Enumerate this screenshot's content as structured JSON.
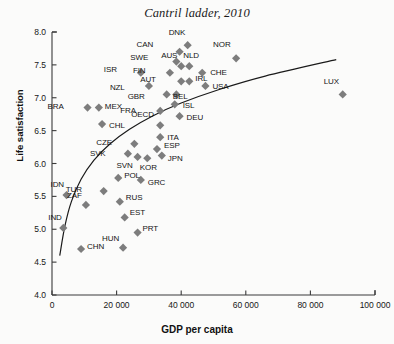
{
  "chart_data": {
    "type": "scatter",
    "title": "Cantril ladder, 2010",
    "xlabel": "GDP per capita",
    "ylabel": "Life satisfaction",
    "xlim": [
      0,
      100000
    ],
    "ylim": [
      4.0,
      8.0
    ],
    "grid": false,
    "legend": null,
    "xticks": [
      "0",
      "20 000",
      "40 000",
      "60 000",
      "80 000",
      "100 000"
    ],
    "xtick_values": [
      0,
      20000,
      40000,
      60000,
      80000,
      100000
    ],
    "yticks": [
      "4.0",
      "4.5",
      "5.0",
      "5.5",
      "6.0",
      "6.5",
      "7.0",
      "7.5",
      "8.0"
    ],
    "ytick_values": [
      4.0,
      4.5,
      5.0,
      5.5,
      6.0,
      6.5,
      7.0,
      7.5,
      8.0
    ],
    "marker": "diamond",
    "marker_color": "#7d7d7d",
    "trendline_color": "#1a1a1a",
    "points": [
      {
        "label": "DNK",
        "x": 42000,
        "y": 7.8,
        "lx": -2,
        "ly": -12
      },
      {
        "label": "CAN",
        "x": 39500,
        "y": 7.7,
        "lx": -26,
        "ly": -7
      },
      {
        "label": "NOR",
        "x": 57000,
        "y": 7.6,
        "lx": -6,
        "ly": -13
      },
      {
        "label": "SWE",
        "x": 38500,
        "y": 7.55,
        "lx": -28,
        "ly": -4
      },
      {
        "label": "AUS",
        "x": 40000,
        "y": 7.48,
        "lx": -4,
        "ly": -10
      },
      {
        "label": "NLD",
        "x": 42500,
        "y": 7.48,
        "lx": 2,
        "ly": -10
      },
      {
        "label": "FIN",
        "x": 36500,
        "y": 7.38,
        "lx": -24,
        "ly": -2
      },
      {
        "label": "CHE",
        "x": 46500,
        "y": 7.38,
        "lx": 8,
        "ly": 0
      },
      {
        "label": "ISR",
        "x": 27500,
        "y": 7.38,
        "lx": -24,
        "ly": -3
      },
      {
        "label": "AUT",
        "x": 40000,
        "y": 7.25,
        "lx": -25,
        "ly": -1
      },
      {
        "label": "IRL",
        "x": 42500,
        "y": 7.25,
        "lx": 6,
        "ly": -2
      },
      {
        "label": "USA",
        "x": 47500,
        "y": 7.18,
        "lx": 7,
        "ly": 1
      },
      {
        "label": "NZL",
        "x": 30000,
        "y": 7.18,
        "lx": -24,
        "ly": 2
      },
      {
        "label": "GBR",
        "x": 35500,
        "y": 7.05,
        "lx": -22,
        "ly": 3
      },
      {
        "label": "BEL",
        "x": 38500,
        "y": 7.05,
        "lx": 4,
        "ly": 3
      },
      {
        "label": "ISL",
        "x": 38000,
        "y": 6.9,
        "lx": 8,
        "ly": 2
      },
      {
        "label": "BRA",
        "x": 11000,
        "y": 6.85,
        "lx": -24,
        "ly": -1
      },
      {
        "label": "MEX",
        "x": 14500,
        "y": 6.85,
        "lx": 6,
        "ly": -1
      },
      {
        "label": "FRA",
        "x": 33500,
        "y": 6.8,
        "lx": -24,
        "ly": 0
      },
      {
        "label": "DEU",
        "x": 39500,
        "y": 6.72,
        "lx": 7,
        "ly": 2
      },
      {
        "label": "CHL",
        "x": 15500,
        "y": 6.6,
        "lx": 7,
        "ly": 2
      },
      {
        "label": "OECD",
        "x": 33500,
        "y": 6.58,
        "lx": -6,
        "ly": -10
      },
      {
        "label": "ITA",
        "x": 33500,
        "y": 6.4,
        "lx": 7,
        "ly": 1
      },
      {
        "label": "CZE",
        "x": 25500,
        "y": 6.3,
        "lx": -22,
        "ly": -1
      },
      {
        "label": "ESP",
        "x": 32500,
        "y": 6.22,
        "lx": 7,
        "ly": -3
      },
      {
        "label": "SVK",
        "x": 23500,
        "y": 6.15,
        "lx": -22,
        "ly": 0
      },
      {
        "label": "JPN",
        "x": 34000,
        "y": 6.12,
        "lx": 6,
        "ly": 3
      },
      {
        "label": "SVN",
        "x": 26500,
        "y": 6.1,
        "lx": -5,
        "ly": 9
      },
      {
        "label": "KOR",
        "x": 29500,
        "y": 6.08,
        "lx": 1,
        "ly": 10
      },
      {
        "label": "POL",
        "x": 20500,
        "y": 5.78,
        "lx": 6,
        "ly": -2
      },
      {
        "label": "GRC",
        "x": 27500,
        "y": 5.75,
        "lx": 7,
        "ly": 3
      },
      {
        "label": "TUR",
        "x": 16000,
        "y": 5.58,
        "lx": -22,
        "ly": -1
      },
      {
        "label": "IDN",
        "x": 4500,
        "y": 5.52,
        "lx": -3,
        "ly": -10
      },
      {
        "label": "RUS",
        "x": 21000,
        "y": 5.42,
        "lx": 6,
        "ly": -4
      },
      {
        "label": "ZAF",
        "x": 10500,
        "y": 5.37,
        "lx": -4,
        "ly": -9
      },
      {
        "label": "EST",
        "x": 22500,
        "y": 5.18,
        "lx": 5,
        "ly": -4
      },
      {
        "label": "IND",
        "x": 3500,
        "y": 5.02,
        "lx": -2,
        "ly": -10
      },
      {
        "label": "PRT",
        "x": 26500,
        "y": 4.95,
        "lx": 5,
        "ly": -4
      },
      {
        "label": "HUN",
        "x": 22000,
        "y": 4.72,
        "lx": -4,
        "ly": -9
      },
      {
        "label": "CHN",
        "x": 9000,
        "y": 4.7,
        "lx": 6,
        "ly": -2
      },
      {
        "label": "LUX",
        "x": 90000,
        "y": 7.05,
        "lx": -4,
        "ly": -12
      }
    ],
    "trendline": {
      "description": "logarithmic fit curve",
      "points": [
        {
          "x": 2400,
          "y": 4.6
        },
        {
          "x": 4000,
          "y": 5.05
        },
        {
          "x": 6000,
          "y": 5.42
        },
        {
          "x": 9000,
          "y": 5.76
        },
        {
          "x": 13000,
          "y": 6.05
        },
        {
          "x": 18000,
          "y": 6.3
        },
        {
          "x": 24000,
          "y": 6.52
        },
        {
          "x": 31000,
          "y": 6.72
        },
        {
          "x": 40000,
          "y": 6.92
        },
        {
          "x": 52000,
          "y": 7.13
        },
        {
          "x": 66000,
          "y": 7.33
        },
        {
          "x": 88000,
          "y": 7.58
        }
      ]
    }
  }
}
